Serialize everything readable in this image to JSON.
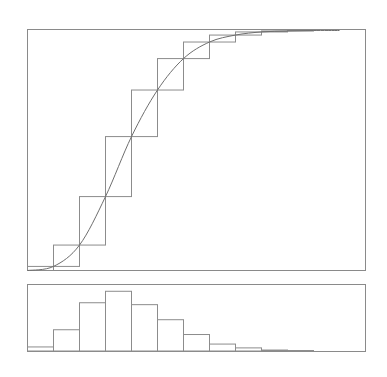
{
  "chart_data": [
    {
      "type": "line",
      "subtype": "cumulative-step-with-smooth-curve",
      "title": "",
      "xlabel": "",
      "ylabel": "",
      "grid": false,
      "legend": "none",
      "bins": 13,
      "xlim": [
        0,
        13
      ],
      "ylim": [
        0,
        1
      ],
      "x": [
        1,
        2,
        3,
        4,
        5,
        6,
        7,
        8,
        9,
        10,
        11
      ],
      "series": [
        {
          "name": "cumulative",
          "values": [
            0.017,
            0.106,
            0.308,
            0.558,
            0.752,
            0.883,
            0.952,
            0.981,
            0.994,
            0.998,
            1.0
          ]
        }
      ]
    },
    {
      "type": "bar",
      "subtype": "histogram",
      "title": "",
      "xlabel": "",
      "ylabel": "",
      "grid": false,
      "legend": "none",
      "xlim": [
        0,
        13
      ],
      "categories": [
        "1",
        "2",
        "3",
        "4",
        "5",
        "6",
        "7",
        "8",
        "9",
        "10",
        "11"
      ],
      "values": [
        0.017,
        0.089,
        0.202,
        0.25,
        0.194,
        0.131,
        0.069,
        0.029,
        0.013,
        0.004,
        0.002
      ],
      "ylim": [
        0,
        0.27
      ]
    }
  ]
}
